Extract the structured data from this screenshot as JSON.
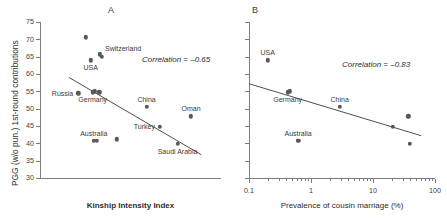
{
  "figure": {
    "background": "#ffffff",
    "point_color": "#58585a",
    "axis_color": "#7d7d7d",
    "line_color": "#3a3a3a"
  },
  "panels": [
    {
      "letter": "A",
      "ylabel": "PGG (w/o pun.) 1st-round contributions",
      "xlabel": "Kinship Intensity Index",
      "annotation": "Correlation = –0.65"
    },
    {
      "letter": "B",
      "ylabel": "",
      "xlabel": "Prevalence of cousin marriage (%)",
      "annotation": "Correlation = –0.83"
    }
  ],
  "chart_data": [
    {
      "type": "scatter",
      "panel": "A",
      "title": "A",
      "xlabel": "Kinship Intensity Index",
      "ylabel": "PGG (w/o pun.) 1st-round contributions",
      "annotations": [
        "Correlation = –0.65"
      ],
      "correlation": -0.65,
      "grid": false,
      "legend": "none",
      "xscale": "linear",
      "yscale": "linear",
      "xlim": [
        -1.6,
        1.9
      ],
      "ylim": [
        30,
        75
      ],
      "xticks": [],
      "xticklabels": [],
      "yticks": [
        30,
        35,
        40,
        45,
        50,
        55,
        60,
        65,
        70,
        75
      ],
      "yticklabels": [
        "30",
        "35",
        "40",
        "45",
        "50",
        "55",
        "60",
        "65",
        "70",
        "75"
      ],
      "points": [
        {
          "label": "",
          "x": -0.72,
          "y": 70.6,
          "label_pos": "none"
        },
        {
          "label": "Switzerland",
          "x": -0.44,
          "y": 65.7,
          "label_pos": "right"
        },
        {
          "label": "",
          "x": -0.4,
          "y": 65.0,
          "label_pos": "none"
        },
        {
          "label": "USA",
          "x": -0.62,
          "y": 63.9,
          "label_pos": "below"
        },
        {
          "label": "Russia",
          "x": -0.86,
          "y": 54.4,
          "label_pos": "left"
        },
        {
          "label": "Germany",
          "x": -0.58,
          "y": 54.7,
          "label_pos": "below"
        },
        {
          "label": "",
          "x": -0.54,
          "y": 55.0,
          "label_pos": "none"
        },
        {
          "label": "",
          "x": -0.45,
          "y": 54.7,
          "label_pos": "none"
        },
        {
          "label": "China",
          "x": 0.46,
          "y": 50.6,
          "label_pos": "above"
        },
        {
          "label": "Oman",
          "x": 1.32,
          "y": 47.8,
          "label_pos": "above"
        },
        {
          "label": "Turkey",
          "x": 0.72,
          "y": 44.8,
          "label_pos": "left"
        },
        {
          "label": "Australia",
          "x": -0.56,
          "y": 40.7,
          "label_pos": "above"
        },
        {
          "label": "",
          "x": -0.5,
          "y": 40.7,
          "label_pos": "none"
        },
        {
          "label": "",
          "x": -0.12,
          "y": 41.2,
          "label_pos": "none"
        },
        {
          "label": "Saudi Arabia",
          "x": 1.06,
          "y": 39.9,
          "label_pos": "below"
        }
      ],
      "trendline": {
        "x0": -1.04,
        "y0": 59.0,
        "x1": 1.52,
        "y1": 36.7
      }
    },
    {
      "type": "scatter",
      "panel": "B",
      "title": "B",
      "xlabel": "Prevalence of cousin marriage (%)",
      "ylabel": "PGG (w/o pun.) 1st-round contributions",
      "annotations": [
        "Correlation = –0.83"
      ],
      "correlation": -0.83,
      "grid": false,
      "legend": "none",
      "xscale": "log",
      "yscale": "linear",
      "xlim": [
        0.1,
        100
      ],
      "ylim": [
        30,
        75
      ],
      "xticks": [
        0.1,
        1,
        10,
        100
      ],
      "xticklabels": [
        "0.1",
        "1",
        "10",
        "100"
      ],
      "yticks": [
        30,
        35,
        40,
        45,
        50,
        55,
        60,
        65,
        70,
        75
      ],
      "yticklabels": [
        "",
        "",
        "",
        "",
        "",
        "",
        "",
        "",
        "",
        ""
      ],
      "points": [
        {
          "label": "USA",
          "x": 0.2,
          "y": 63.9,
          "label_pos": "above"
        },
        {
          "label": "Germany",
          "x": 0.42,
          "y": 54.7,
          "label_pos": "below"
        },
        {
          "label": "",
          "x": 0.46,
          "y": 55.0,
          "label_pos": "none"
        },
        {
          "label": "China",
          "x": 2.9,
          "y": 50.6,
          "label_pos": "above"
        },
        {
          "label": "Australia",
          "x": 0.62,
          "y": 40.7,
          "label_pos": "above"
        },
        {
          "label": "",
          "x": 21.0,
          "y": 44.8,
          "label_pos": "none"
        },
        {
          "label": "",
          "x": 37.0,
          "y": 47.8,
          "label_pos": "none"
        },
        {
          "label": "",
          "x": 39.0,
          "y": 39.9,
          "label_pos": "none"
        }
      ],
      "trendline": {
        "x0": 0.1,
        "y0": 57.2,
        "x1": 60.0,
        "y1": 42.2
      }
    }
  ]
}
